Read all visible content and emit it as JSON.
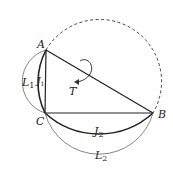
{
  "diagram": {
    "points": {
      "A": {
        "label": "A",
        "x": 46,
        "y": 50
      },
      "B": {
        "label": "B",
        "x": 153,
        "y": 113
      },
      "C": {
        "label": "C",
        "x": 45,
        "y": 113
      }
    },
    "labels": {
      "L1": {
        "main": "L",
        "sub": "1"
      },
      "J1": {
        "main": "J",
        "sub": "1"
      },
      "J2": {
        "main": "J",
        "sub": "2"
      },
      "L2": {
        "main": "L",
        "sub": "2"
      },
      "T": {
        "main": "T"
      }
    },
    "colors": {
      "stroke": "#222222",
      "thin": "#555555"
    }
  }
}
